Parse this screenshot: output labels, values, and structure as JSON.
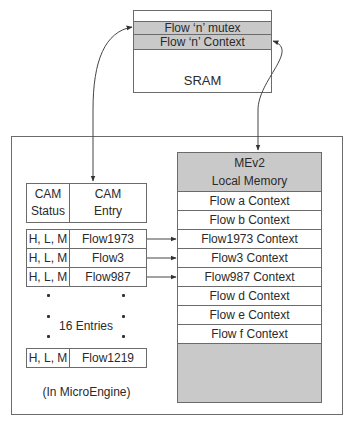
{
  "sram": {
    "rows": [
      "Flow ‘n’ mutex",
      "Flow ‘n’ Context"
    ],
    "label": "SRAM"
  },
  "cam_table": {
    "headers": [
      [
        "CAM",
        "Status"
      ],
      [
        "CAM",
        "Entry"
      ]
    ],
    "rows": [
      {
        "status": "H, L, M",
        "entry": "Flow1973"
      },
      {
        "status": "H, L, M",
        "entry": "Flow3"
      },
      {
        "status": "H, L, M",
        "entry": "Flow987"
      }
    ],
    "ellipsis_label": "16 Entries",
    "last_row": {
      "status": "H, L, M",
      "entry": "Flow1219"
    },
    "caption": "(In MicroEngine)"
  },
  "local_memory": {
    "title": [
      "MEv2",
      "Local Memory"
    ],
    "rows": [
      "Flow a Context",
      "Flow b Context",
      "Flow1973 Context",
      "Flow3 Context",
      "Flow987 Context",
      "Flow d Context",
      "Flow e Context",
      "Flow f Context"
    ]
  },
  "colors": {
    "shade": "#c9c9c9",
    "line": "#6b6b6b"
  }
}
